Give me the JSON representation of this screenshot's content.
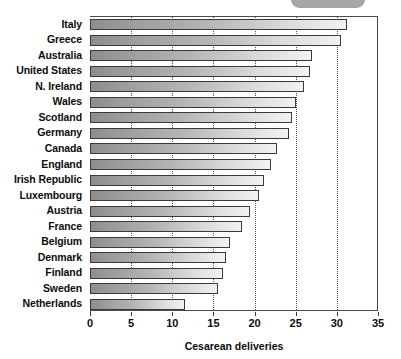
{
  "chart_data": {
    "type": "bar",
    "orientation": "horizontal",
    "title": "",
    "xlabel": "Cesarean deliveries",
    "ylabel": "",
    "xlim": [
      0,
      35
    ],
    "xticks": [
      0,
      5,
      10,
      15,
      20,
      25,
      30,
      35
    ],
    "grid": "vertical-dotted",
    "legend": null,
    "categories": [
      "Italy",
      "Greece",
      "Australia",
      "United States",
      "N. Ireland",
      "Wales",
      "Scotland",
      "Germany",
      "Canada",
      "England",
      "Irish Republic",
      "Luxembourg",
      "Austria",
      "France",
      "Belgium",
      "Denmark",
      "Finland",
      "Sweden",
      "Netherlands"
    ],
    "values": [
      31.2,
      30.5,
      27.0,
      26.7,
      26.0,
      25.0,
      24.5,
      24.2,
      22.7,
      22.0,
      21.1,
      20.5,
      19.5,
      18.5,
      17.0,
      16.5,
      16.2,
      15.5,
      11.5
    ]
  },
  "axis": {
    "tick_labels": [
      "0",
      "5",
      "10",
      "15",
      "20",
      "25",
      "30",
      "35"
    ],
    "x_title": "Cesarean deliveries"
  },
  "artifact": {
    "name": "top-rounded-tab"
  }
}
